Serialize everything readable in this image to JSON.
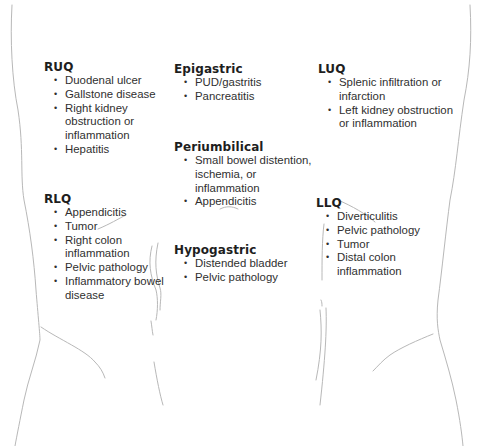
{
  "figure": {
    "type": "abdominal-quadrant-diagram",
    "regions": {
      "ruq": {
        "title": "RUQ",
        "items": [
          "Duodenal ulcer",
          "Gallstone disease",
          "Right kidney obstruction or inflammation",
          "Hepatitis"
        ]
      },
      "epigastric": {
        "title": "Epigastric",
        "items": [
          "PUD/gastritis",
          "Pancreatitis"
        ]
      },
      "luq": {
        "title": "LUQ",
        "items": [
          "Splenic infiltration or infarction",
          "Left kidney obstruction or inflammation"
        ]
      },
      "periumbilical": {
        "title": "Periumbilical",
        "items": [
          "Small bowel distention, ischemia, or inflammation",
          "Appendicitis"
        ]
      },
      "rlq": {
        "title": "RLQ",
        "items": [
          "Appendicitis",
          "Tumor",
          "Right colon inflammation",
          "Pelvic pathology",
          "Inflammatory bowel disease"
        ]
      },
      "hypogastric": {
        "title": "Hypogastric",
        "items": [
          "Distended bladder",
          "Pelvic pathology"
        ]
      },
      "llq": {
        "title": "LLQ",
        "items": [
          "Diverticulitis",
          "Pelvic pathology",
          "Tumor",
          "Distal colon inflammation"
        ]
      }
    },
    "bullet_glyph": "•",
    "colors": {
      "background": "#ffffff",
      "outline": "#b8b8b8",
      "title_text": "#1e1e1e",
      "body_text": "#2f2f2f"
    }
  }
}
